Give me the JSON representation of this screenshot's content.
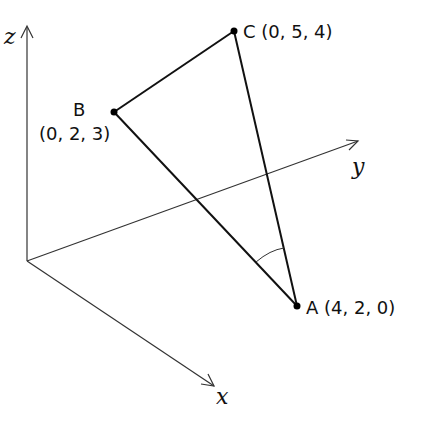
{
  "diagram": {
    "type": "3d-coordinate-triangle",
    "axes": {
      "x": {
        "label": "x"
      },
      "y": {
        "label": "y"
      },
      "z": {
        "label": "z"
      }
    },
    "points": {
      "A": {
        "name": "A",
        "coords": "(4, 2, 0)",
        "label": "A (4, 2, 0)"
      },
      "B": {
        "name": "B",
        "coords": "(0, 2, 3)"
      },
      "C": {
        "name": "C",
        "coords": "(0, 5, 4)",
        "label": "C (0, 5, 4)"
      }
    },
    "marked_angle": "BAC",
    "colors": {
      "line": "#111111",
      "axis": "#333333",
      "background": "#ffffff"
    }
  }
}
